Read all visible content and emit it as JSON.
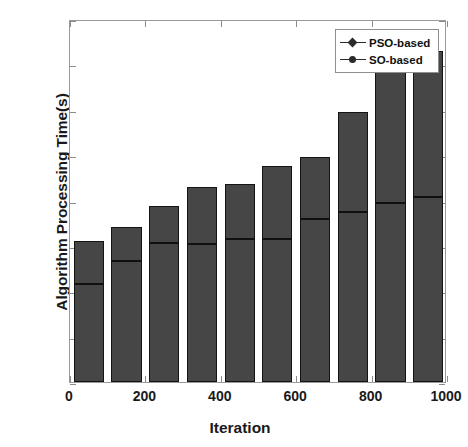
{
  "chart_data": {
    "type": "bar",
    "title": "",
    "xlabel": "Iteration",
    "ylabel": "Algorithm Processing Time(s)",
    "x": [
      0,
      100,
      200,
      300,
      400,
      500,
      600,
      700,
      800,
      900
    ],
    "xlim": [
      0,
      1000
    ],
    "ylim": [
      0,
      0.8
    ],
    "xticks": [
      0,
      200,
      400,
      600,
      800,
      1000
    ],
    "xtick_labels": [
      "0",
      "200",
      "400",
      "600",
      "800",
      "1000"
    ],
    "yticks": [
      0,
      0.1,
      0.2,
      0.3,
      0.4,
      0.5,
      0.6,
      0.7,
      0.8
    ],
    "ytick_labels": [
      "0",
      "0.1",
      "0.2",
      "0.3",
      "0.4",
      "0.5",
      "0.6",
      "0.7",
      "0.8"
    ],
    "grid": false,
    "legend_position": "top-right",
    "series": [
      {
        "name": "PSO-based",
        "marker": "diamond",
        "values": [
          0.31,
          0.342,
          0.389,
          0.43,
          0.436,
          0.477,
          0.497,
          0.596,
          0.7,
          0.73
        ]
      },
      {
        "name": "SO-based",
        "marker": "circle",
        "values": [
          0.22,
          0.272,
          0.31,
          0.308,
          0.32,
          0.32,
          0.364,
          0.378,
          0.4,
          0.412
        ]
      }
    ],
    "colors": {
      "bar_fill": "#464646",
      "bar_edge": "#141414",
      "inner_line": "#101010",
      "axis": "#9a9a9a",
      "text": "#1a1a1a",
      "background": "#ffffff"
    }
  },
  "legend": {
    "items": [
      {
        "label": "PSO-based"
      },
      {
        "label": "SO-based"
      }
    ]
  },
  "caption": {
    "text": ""
  }
}
